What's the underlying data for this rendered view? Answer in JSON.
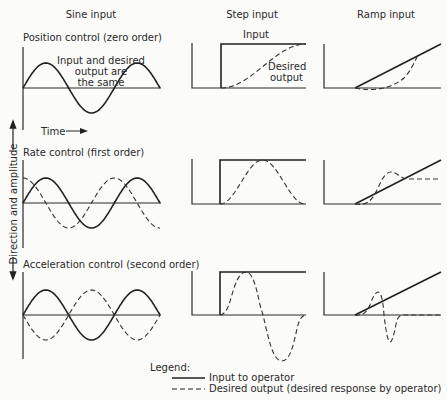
{
  "figure": {
    "column_headers": [
      "Sine input",
      "Step input",
      "Ramp input"
    ],
    "row_labels": [
      "Position control (zero order)",
      "Rate control (first order)",
      "Acceleration control (second order)"
    ],
    "y_axis_label": "Direction and amplitude",
    "time_label": "Time",
    "annotations": {
      "input": "Input",
      "desired_output_line1": "Desired",
      "desired_output_line2": "output",
      "same_line1": "Input and desired",
      "same_line2": "output are",
      "same_line3": "the same"
    },
    "legend": {
      "title": "Legend:",
      "items": [
        {
          "style": "solid",
          "label": "Input to operator"
        },
        {
          "style": "dashed",
          "label": "Desired output (desired response by operator)"
        }
      ]
    },
    "colors": {
      "ink": "#222222",
      "paper": "#fbfbf9"
    }
  },
  "chart_data": {
    "type": "line",
    "columns": [
      "Sine input",
      "Step input",
      "Ramp input"
    ],
    "rows": [
      "Position control (zero order)",
      "Rate control (first order)",
      "Acceleration control (second order)"
    ],
    "xlabel": "Time",
    "ylabel": "Direction and amplitude",
    "panels": [
      {
        "row": "Position control (zero order)",
        "col": "Sine input",
        "input": "sin(t), 1.5 cycles",
        "desired_output": "same as input"
      },
      {
        "row": "Position control (zero order)",
        "col": "Step input",
        "input": "step 0 -> 1",
        "desired_output": "smooth S-curve rising 0 -> 1"
      },
      {
        "row": "Position control (zero order)",
        "col": "Ramp input",
        "input": "ramp",
        "desired_output": "lags then joins ramp"
      },
      {
        "row": "Rate control (first order)",
        "col": "Sine input",
        "input": "sin(t)",
        "desired_output": "cos(t) (derivative, leads by 90 deg)"
      },
      {
        "row": "Rate control (first order)",
        "col": "Step input",
        "input": "step 0 -> 1",
        "desired_output": "bell-shaped pulse returning to 0"
      },
      {
        "row": "Rate control (first order)",
        "col": "Ramp input",
        "input": "ramp",
        "desired_output": "overshoot then constant level"
      },
      {
        "row": "Acceleration control (second order)",
        "col": "Sine input",
        "input": "sin(t)",
        "desired_output": "-sin(t) (inverted)"
      },
      {
        "row": "Acceleration control (second order)",
        "col": "Step input",
        "input": "step 0 -> 1",
        "desired_output": "positive lobe then negative lobe returning to 0"
      },
      {
        "row": "Acceleration control (second order)",
        "col": "Ramp input",
        "input": "ramp",
        "desired_output": "small positive then negative pulse, then 0"
      }
    ]
  }
}
